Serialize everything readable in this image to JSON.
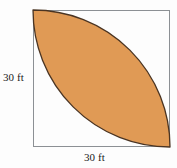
{
  "figure": {
    "kind": "geometry-diagram",
    "background_color": "#fdfdfd",
    "square": {
      "name": "square-outline",
      "x": 33,
      "y": 10,
      "width": 137,
      "height": 137,
      "stroke_color": "#8c9094",
      "stroke_width": 1,
      "fill_color": "none"
    },
    "lens": {
      "name": "shaded-lens-region",
      "fill_color": "#e09a55",
      "stroke_color": "#4a3422",
      "stroke_width": 1.3,
      "arc_radius": 137,
      "start_corner": "top-left",
      "end_corner": "bottom-right",
      "arc_centers": [
        "bottom-left-corner",
        "top-right-corner"
      ]
    },
    "labels": {
      "left": {
        "name": "left-dimension-label",
        "text": "30 ft",
        "value": 30,
        "unit": "ft",
        "side": "left"
      },
      "bottom": {
        "name": "bottom-dimension-label",
        "text": "30 ft",
        "value": 30,
        "unit": "ft",
        "side": "bottom"
      }
    }
  }
}
